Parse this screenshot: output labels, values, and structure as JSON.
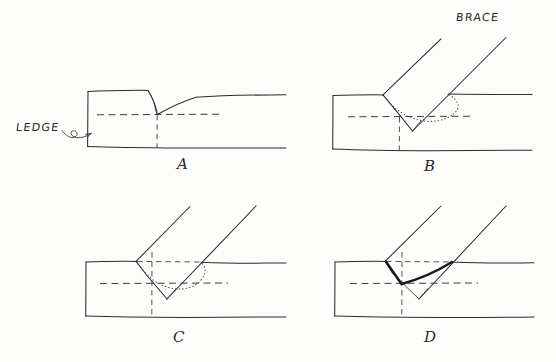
{
  "figure": {
    "medium": "hand-drawn pen sketch",
    "background_color": "#fdfdfc",
    "ink_color": "#2b2b2b"
  },
  "annotations": {
    "ledge_label": "LEDGE",
    "brace_label": "BRACE"
  },
  "panels": [
    {
      "letter": "A",
      "caption": "A",
      "description": "Beam end with V notch cut down to centerline and sloped ledge",
      "parts_shown": [
        "beam",
        "ledge",
        "notch",
        "centerline"
      ]
    },
    {
      "letter": "B",
      "caption": "B",
      "description": "Brace laid into notch at a steep angle, dotted hidden edge shown",
      "parts_shown": [
        "beam",
        "brace",
        "notch",
        "hidden-edge",
        "centerline"
      ]
    },
    {
      "letter": "C",
      "caption": "C",
      "description": "Brace rotated more upright in notch with layout dashes at beam face",
      "parts_shown": [
        "beam",
        "brace",
        "notch",
        "hidden-edge",
        "layout-lines",
        "centerline"
      ]
    },
    {
      "letter": "D",
      "caption": "D",
      "description": "Final seated brace with heavy bearing V line marked",
      "parts_shown": [
        "beam",
        "brace",
        "notch",
        "bearing-line",
        "layout-lines",
        "centerline"
      ]
    }
  ],
  "colors": {
    "ink": "#2b2b2b",
    "ink_bold": "#1a1a1a",
    "dashed": "#3d3d3d",
    "dotted": "#5a5a5a",
    "paper": "#fdfdfc"
  }
}
